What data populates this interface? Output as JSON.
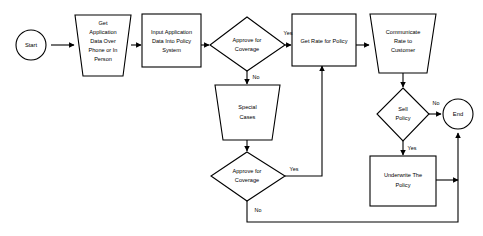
{
  "diagram": {
    "type": "flowchart",
    "stroke_color": "#000000",
    "fill_color": "#ffffff",
    "background_color": "#ffffff"
  },
  "nodes": {
    "start": {
      "label": "Start",
      "shape": "circle"
    },
    "get_application": {
      "line1": "Get",
      "line2": "Application",
      "line3": "Data Over",
      "line4": "Phone or In",
      "line5": "Person",
      "shape": "trapezoid"
    },
    "input_application": {
      "line1": "Input Application",
      "line2": "Data Into Policy",
      "line3": "System",
      "shape": "rectangle"
    },
    "approve_coverage_1": {
      "line1": "Approve for",
      "line2": "Coverage",
      "shape": "diamond"
    },
    "special_cases": {
      "line1": "Special",
      "line2": "Cases",
      "shape": "trapezoid"
    },
    "approve_coverage_2": {
      "line1": "Approve for",
      "line2": "Coverage",
      "shape": "diamond"
    },
    "get_rate": {
      "line1": "Get Rate for Policy",
      "shape": "rectangle"
    },
    "communicate_rate": {
      "line1": "Communicate",
      "line2": "Rate to",
      "line3": "Customer",
      "shape": "trapezoid"
    },
    "sell_policy": {
      "line1": "Sell",
      "line2": "Policy",
      "shape": "diamond"
    },
    "underwrite": {
      "line1": "Underwrite The",
      "line2": "Policy",
      "shape": "rectangle"
    },
    "end": {
      "label": "End",
      "shape": "circle"
    }
  },
  "edge_labels": {
    "approve1_yes": "Yes",
    "approve1_no": "No",
    "approve2_yes": "Yes",
    "approve2_no": "No",
    "sell_no": "No",
    "sell_yes": "Yes"
  }
}
